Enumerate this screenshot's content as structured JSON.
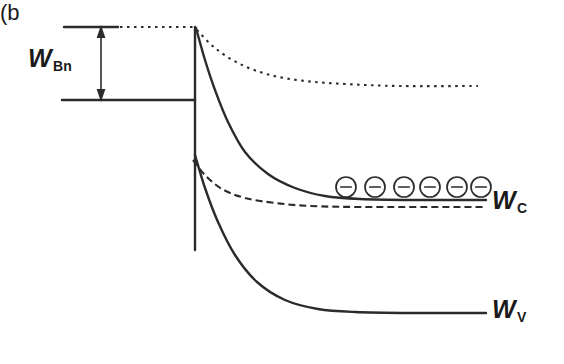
{
  "figure": {
    "kind": "energy-band-diagram",
    "panel_caption": "(b",
    "background_color": "#ffffff",
    "line_color": "#2b2b2b"
  },
  "labels": {
    "barrier": {
      "symbol": "W",
      "subscript": "Bn",
      "full": "WBn"
    },
    "conduction_band": {
      "symbol": "W",
      "subscript": "C",
      "full": "WC"
    },
    "valence_band": {
      "symbol": "W",
      "subscript": "V",
      "full": "WV"
    }
  },
  "carriers": {
    "icon": "electron-circle-minus-icon",
    "glyph": "−",
    "count": 6,
    "x_positions": [
      346,
      375,
      404,
      430,
      457,
      481
    ],
    "y": 187,
    "radius": 10
  },
  "geometry": {
    "junction_x": 195,
    "metal_left_x": 62,
    "right_edge_x": 486,
    "vacuum_dotted_y": 27,
    "metal_fermi_y": 100,
    "semiconductor_fermi_far_y": 207,
    "conduction_far_y": 200,
    "valence_far_y": 313,
    "top_dashed_far_y": 86,
    "junction_bottom_y": 250
  },
  "chart_data": {
    "type": "line",
    "title": "",
    "xlabel": "",
    "ylabel": "",
    "grid": false,
    "legend_position": "none",
    "annotations": [
      "WBn",
      "WC",
      "WV",
      "(b"
    ],
    "series": [
      {
        "name": "metal-fermi-level",
        "style": "solid",
        "points": [
          [
            62,
            100
          ],
          [
            195,
            100
          ]
        ]
      },
      {
        "name": "metal-vacuum-reference-solid",
        "style": "solid",
        "points": [
          [
            64,
            27
          ],
          [
            118,
            27
          ]
        ]
      },
      {
        "name": "vacuum-level-dotted-flat",
        "style": "dotted",
        "points": [
          [
            120,
            27
          ],
          [
            195,
            27
          ]
        ]
      },
      {
        "name": "junction-interface-vertical",
        "style": "solid",
        "points": [
          [
            195,
            27
          ],
          [
            195,
            250
          ]
        ]
      },
      {
        "name": "vacuum-level-bending-dotted",
        "style": "dotted",
        "points": [
          [
            197,
            30
          ],
          [
            215,
            48
          ],
          [
            240,
            64
          ],
          [
            270,
            75
          ],
          [
            305,
            81
          ],
          [
            345,
            84
          ],
          [
            400,
            86
          ],
          [
            478,
            86
          ]
        ]
      },
      {
        "name": "conduction-band-edge",
        "style": "solid",
        "points": [
          [
            196,
            28
          ],
          [
            205,
            60
          ],
          [
            215,
            90
          ],
          [
            228,
            122
          ],
          [
            245,
            152
          ],
          [
            268,
            174
          ],
          [
            295,
            188
          ],
          [
            325,
            196
          ],
          [
            360,
            199
          ],
          [
            410,
            200
          ],
          [
            486,
            200
          ]
        ]
      },
      {
        "name": "semiconductor-fermi-level-dashed",
        "style": "dashed",
        "points": [
          [
            193,
            160
          ],
          [
            205,
            175
          ],
          [
            222,
            189
          ],
          [
            245,
            198
          ],
          [
            275,
            203
          ],
          [
            310,
            206
          ],
          [
            360,
            207
          ],
          [
            420,
            207
          ],
          [
            486,
            207
          ]
        ]
      },
      {
        "name": "valence-band-edge",
        "style": "solid",
        "points": [
          [
            195,
            155
          ],
          [
            205,
            188
          ],
          [
            218,
            222
          ],
          [
            235,
            255
          ],
          [
            257,
            282
          ],
          [
            285,
            300
          ],
          [
            318,
            309
          ],
          [
            355,
            312
          ],
          [
            410,
            313
          ],
          [
            486,
            313
          ]
        ]
      }
    ],
    "xlim": [
      0,
      564
    ],
    "ylim": [
      364,
      0
    ]
  }
}
